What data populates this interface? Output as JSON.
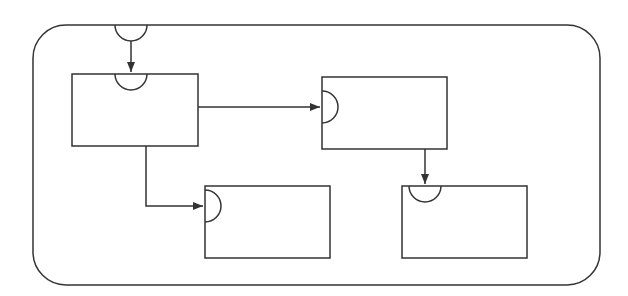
{
  "diagram": {
    "type": "block-flow",
    "stroke_color": "#333333",
    "background": "#ffffff",
    "container": {
      "x": 33,
      "y": 25,
      "w": 567,
      "h": 260,
      "r": 33
    },
    "container_port": {
      "cx": 131,
      "cy": 25,
      "r": 16,
      "side": "top"
    },
    "blocks": [
      {
        "id": "block-1",
        "x": 72,
        "y": 74,
        "w": 126,
        "h": 72,
        "port": {
          "side": "top",
          "cx": 131,
          "cy": 74,
          "r": 16
        }
      },
      {
        "id": "block-2",
        "x": 322,
        "y": 77,
        "w": 125,
        "h": 72,
        "port": {
          "side": "left",
          "cx": 322,
          "cy": 107,
          "r": 16
        }
      },
      {
        "id": "block-3",
        "x": 205,
        "y": 186,
        "w": 125,
        "h": 72,
        "port": {
          "side": "left",
          "cx": 205,
          "cy": 206,
          "r": 16
        }
      },
      {
        "id": "block-4",
        "x": 402,
        "y": 186,
        "w": 125,
        "h": 72,
        "port": {
          "side": "top",
          "cx": 425,
          "cy": 186,
          "r": 16
        }
      }
    ],
    "connections": [
      {
        "from": "container-port",
        "to": "block-1",
        "points": "131,41 131,72"
      },
      {
        "from": "block-1",
        "to": "block-2",
        "points": "198,107 320,107"
      },
      {
        "from": "block-1",
        "to": "block-3",
        "points": "146,146 146,206 203,206"
      },
      {
        "from": "block-2",
        "to": "block-4",
        "points": "425,149 425,184"
      }
    ]
  }
}
